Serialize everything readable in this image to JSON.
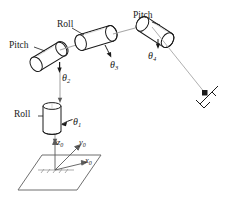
{
  "figure": {
    "type": "kinematic-diagram",
    "background_color": "#ffffff",
    "stroke_color": "#1a1a1a",
    "link_color": "#8a8a8a",
    "ground_color": "#7a7a7a"
  },
  "joint_labels": [
    {
      "id": "joint1",
      "type": "Roll",
      "name": "Roll",
      "symbol": "θ",
      "subscript": "1"
    },
    {
      "id": "joint2",
      "type": "Pitch",
      "name": "Pitch",
      "symbol": "θ",
      "subscript": "2"
    },
    {
      "id": "joint3",
      "type": "Roll",
      "name": "Roll",
      "symbol": "θ",
      "subscript": "3"
    },
    {
      "id": "joint4",
      "type": "Pitch",
      "name": "Pitch",
      "symbol": "θ",
      "subscript": "4"
    }
  ],
  "frame_axes": [
    {
      "id": "axis-z",
      "symbol": "z",
      "subscript": "0"
    },
    {
      "id": "axis-y",
      "symbol": "y",
      "subscript": "0"
    },
    {
      "id": "axis-x",
      "symbol": "x",
      "subscript": "0"
    }
  ],
  "end_effector": {
    "name": "gripper"
  },
  "ground": {
    "name": "base-plane"
  }
}
